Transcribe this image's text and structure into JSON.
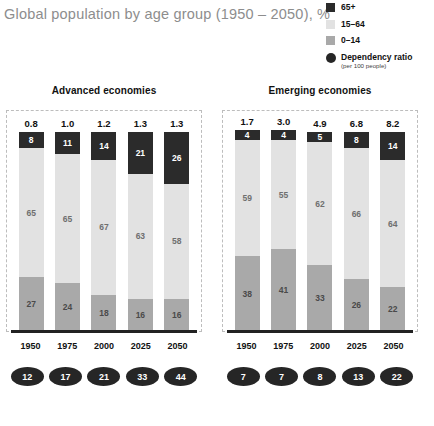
{
  "title": "Global population by age group (1950 – 2050), %",
  "legend": {
    "items": [
      {
        "label": "65+",
        "sub": "",
        "color": "#2b2b2b",
        "shape": "square"
      },
      {
        "label": "15–64",
        "sub": "",
        "color": "#e2e2e2",
        "shape": "square"
      },
      {
        "label": "0–14",
        "sub": "",
        "color": "#a9a9a9",
        "shape": "square"
      },
      {
        "label": "Dependency ratio",
        "sub": "(per 100 people)",
        "color": "#262626",
        "shape": "circle"
      }
    ]
  },
  "panels": [
    {
      "name": "Advanced economies",
      "years": [
        "1950",
        "1975",
        "2000",
        "2025",
        "2050"
      ],
      "top_labels": [
        "0.8",
        "1.0",
        "1.2",
        "1.3",
        "1.3"
      ],
      "seg_65": [
        "8",
        "11",
        "14",
        "21",
        "26"
      ],
      "seg_1564": [
        "65",
        "65",
        "67",
        "63",
        "58"
      ],
      "seg_014": [
        "27",
        "24",
        "18",
        "16",
        "16"
      ],
      "ratios": [
        "12",
        "17",
        "21",
        "33",
        "44"
      ]
    },
    {
      "name": "Emerging economies",
      "years": [
        "1950",
        "1975",
        "2000",
        "2025",
        "2050"
      ],
      "top_labels": [
        "1.7",
        "3.0",
        "4.9",
        "6.8",
        "8.2"
      ],
      "seg_65": [
        "4",
        "4",
        "5",
        "8",
        "14"
      ],
      "seg_1564": [
        "59",
        "55",
        "62",
        "66",
        "64"
      ],
      "seg_014": [
        "38",
        "41",
        "33",
        "26",
        "22"
      ],
      "ratios": [
        "7",
        "7",
        "8",
        "13",
        "22"
      ]
    }
  ],
  "chart_data": {
    "type": "bar",
    "title": "Global population by age group (1950 – 2050), %",
    "subtype": "stacked-bar-100pct",
    "xlabel": "",
    "ylabel": "%",
    "ylim": [
      0,
      100
    ],
    "grid": false,
    "legend_position": "top-right",
    "categories": [
      "1950",
      "1975",
      "2000",
      "2025",
      "2050"
    ],
    "panels": [
      {
        "name": "Advanced economies",
        "series": [
          {
            "name": "0–14",
            "values": [
              27,
              24,
              18,
              16,
              16
            ],
            "color": "#a9a9a9"
          },
          {
            "name": "15–64",
            "values": [
              65,
              65,
              67,
              63,
              58
            ],
            "color": "#e2e2e2"
          },
          {
            "name": "65+",
            "values": [
              8,
              11,
              14,
              21,
              26
            ],
            "color": "#2b2b2b"
          }
        ],
        "annotations": {
          "population_billions": [
            0.8,
            1.0,
            1.2,
            1.3,
            1.3
          ],
          "dependency_ratio_per_100": [
            12,
            17,
            21,
            33,
            44
          ]
        }
      },
      {
        "name": "Emerging economies",
        "series": [
          {
            "name": "0–14",
            "values": [
              38,
              41,
              33,
              26,
              22
            ],
            "color": "#a9a9a9"
          },
          {
            "name": "15–64",
            "values": [
              59,
              55,
              62,
              66,
              64
            ],
            "color": "#e2e2e2"
          },
          {
            "name": "65+",
            "values": [
              4,
              4,
              5,
              8,
              14
            ],
            "color": "#2b2b2b"
          }
        ],
        "annotations": {
          "population_billions": [
            1.7,
            3.0,
            4.9,
            6.8,
            8.2
          ],
          "dependency_ratio_per_100": [
            7,
            7,
            8,
            13,
            22
          ]
        }
      }
    ]
  },
  "colors": {
    "age_65_plus": "#2b2b2b",
    "age_15_64": "#e2e2e2",
    "age_0_14": "#a9a9a9",
    "dependency": "#262626",
    "title_text": "#8d8d8d"
  }
}
